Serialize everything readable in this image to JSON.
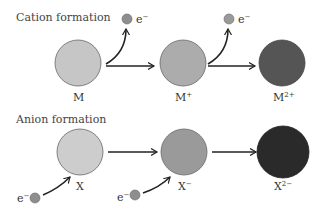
{
  "cation": {
    "title": "Cation formation",
    "species": [
      {
        "base": "M",
        "charge": "",
        "color": "#c6c6c6"
      },
      {
        "base": "M",
        "charge": "+",
        "color": "#acacac"
      },
      {
        "base": "M",
        "charge": "2+",
        "color": "#555555"
      }
    ],
    "electron_label": "e",
    "electron_charge": "−"
  },
  "anion": {
    "title": "Anion formation",
    "species": [
      {
        "base": "X",
        "charge": "",
        "color": "#cdcdcd"
      },
      {
        "base": "X",
        "charge": "−",
        "color": "#9a9a9a"
      },
      {
        "base": "X",
        "charge": "2−",
        "color": "#2a2a2a"
      }
    ],
    "electron_label": "e",
    "electron_charge": "−"
  },
  "colors": {
    "electron": "#8e8e8e",
    "arrow": "#222222",
    "stroke": "#555555"
  }
}
